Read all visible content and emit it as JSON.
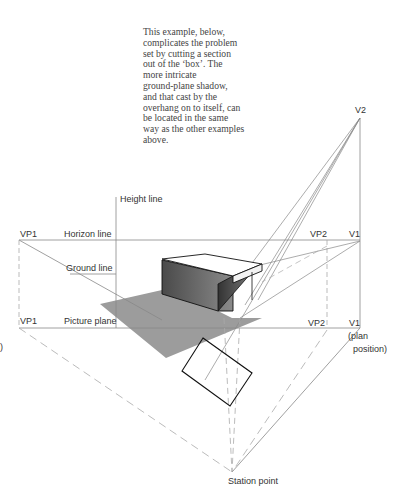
{
  "caption": {
    "lines": [
      "This example, below,",
      "complicates the problem",
      "set by cutting a section",
      "out of the ‘box’. The",
      "more intricate",
      "ground-plane shadow,",
      "and that cast by the",
      "overhang on to itself, can",
      "be located in the same",
      "way as the other examples",
      "above."
    ]
  },
  "labels": {
    "height_line": "Height line",
    "vp1_horizon": "VP1",
    "horizon_line": "Horizon line",
    "ground_line": "Ground line",
    "vp1_picture": "VP1",
    "picture_plane": "Picture plane",
    "vp2_horizon": "VP2",
    "v1_horizon": "V1",
    "vp2_picture": "VP2",
    "v1_picture": "V1",
    "plan": "(plan",
    "position": "position)",
    "v2": "V2",
    "station_point": "Station point",
    "stray_paren": ")"
  },
  "colors": {
    "line": "#888888",
    "dashed": "#aaaaaa",
    "shadow": "#9a9a9a",
    "box_front": "#5a5a5a",
    "box_top": "#ffffff",
    "ink": "#111111"
  }
}
